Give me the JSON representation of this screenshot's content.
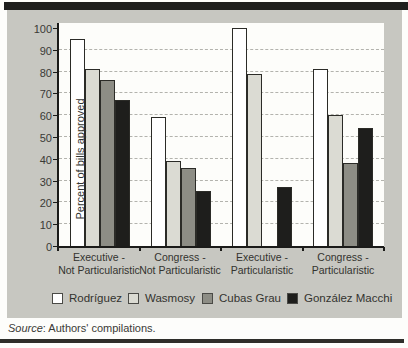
{
  "figure": {
    "source_label": "Source",
    "source_rest": ": Authors' compilations."
  },
  "chart_data": {
    "type": "bar",
    "title": "",
    "xlabel": "",
    "ylabel": "Percent of bills approved",
    "ylim": [
      0,
      100
    ],
    "yticks": [
      0,
      10,
      20,
      30,
      40,
      50,
      60,
      70,
      80,
      90,
      100
    ],
    "gridline_values": [
      10,
      20,
      30,
      40,
      50,
      60,
      70,
      80,
      90
    ],
    "grid_style": "dashed",
    "legend_position": "bottom",
    "categories": [
      [
        "Executive -",
        "Not Particularistic"
      ],
      [
        "Congress -",
        "Not Particularistic"
      ],
      [
        "Executive -",
        "Particularistic"
      ],
      [
        "Congress -",
        "Particularistic"
      ]
    ],
    "series": [
      {
        "name": "Rodríguez",
        "color": "#ffffff",
        "values": [
          95,
          59,
          100,
          81
        ]
      },
      {
        "name": "Wasmosy",
        "color": "#dbdbd3",
        "values": [
          81,
          39,
          79,
          60
        ]
      },
      {
        "name": "Cubas Grau",
        "color": "#8d8d85",
        "values": [
          76,
          36,
          0,
          38
        ]
      },
      {
        "name": "González Macchi",
        "color": "#1e1e1c",
        "values": [
          67,
          25,
          27,
          54
        ]
      }
    ]
  }
}
